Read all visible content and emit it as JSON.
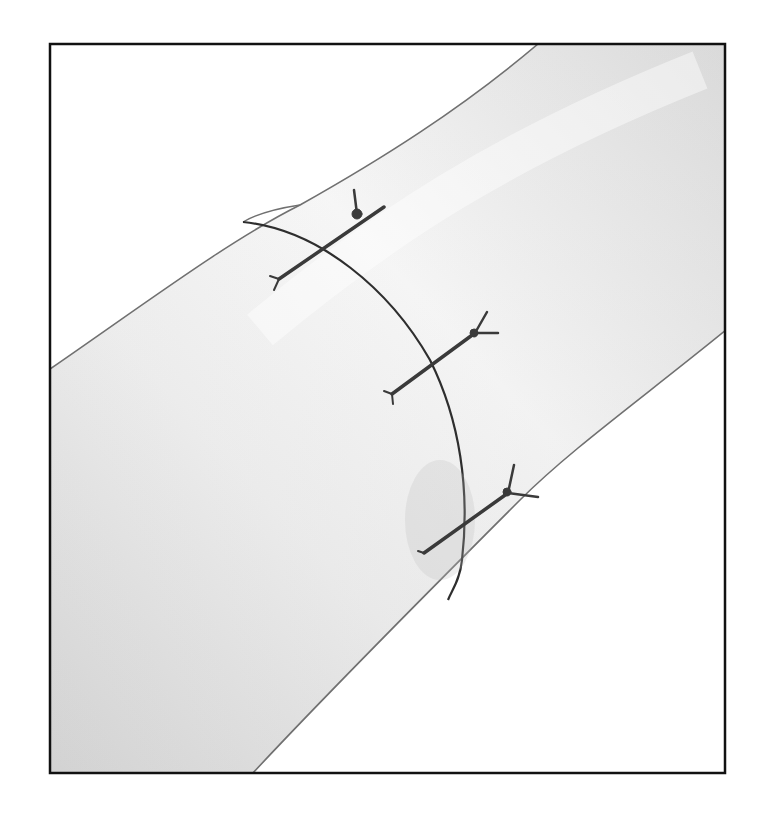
{
  "figure": {
    "frame": {
      "x": 49,
      "y": 43,
      "width": 677,
      "height": 731,
      "stroke": "#111111"
    },
    "colors": {
      "background": "#ffffff",
      "tube_light": "#f4f4f4",
      "tube_shade": "#d6d6d6",
      "outline": "#6a6a6a",
      "suture": "#3a3a3a"
    },
    "sutures": [
      {
        "name": "suture-top",
        "from": [
          279,
          279
        ],
        "to": [
          384,
          207
        ],
        "knot": [
          357,
          214
        ]
      },
      {
        "name": "suture-middle",
        "from": [
          392,
          394
        ],
        "to": [
          496,
          337
        ],
        "knot": [
          475,
          330
        ]
      },
      {
        "name": "suture-bottom",
        "from": [
          424,
          553
        ],
        "to": [
          538,
          497
        ],
        "knot": [
          509,
          487
        ]
      }
    ]
  }
}
